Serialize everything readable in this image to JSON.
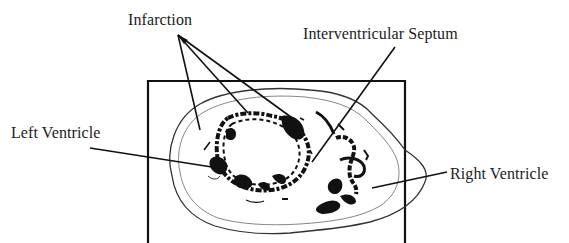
{
  "figure": {
    "labels": {
      "infarction": "Infarction",
      "septum": "Interventricular Septum",
      "left_ventricle": "Left Ventricle",
      "right_ventricle": "Right Ventricle"
    },
    "colors": {
      "ink": "#111111",
      "thin_outline": "#555555",
      "label_text": "#222222",
      "background": "#ffffff"
    }
  }
}
